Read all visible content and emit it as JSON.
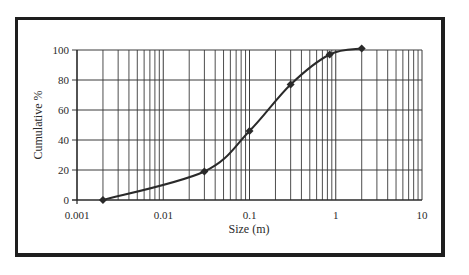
{
  "chart_data": {
    "type": "line",
    "title": "",
    "xlabel": "Size (m)",
    "ylabel": "Cumulative %",
    "xscale": "log",
    "xlim": [
      0.001,
      10
    ],
    "ylim": [
      0,
      100
    ],
    "x_ticks": [
      "0.001",
      "0.01",
      "0.1",
      "1",
      "10"
    ],
    "y_ticks": [
      "0",
      "20",
      "40",
      "60",
      "80",
      "100"
    ],
    "grid": true,
    "legend": null,
    "series": [
      {
        "name": "Cumulative %",
        "marker": "diamond",
        "color": "#2a2a2a",
        "x": [
          0.002,
          0.03,
          0.1,
          0.3,
          0.85,
          2.0
        ],
        "y": [
          0,
          19,
          46,
          77,
          97,
          101
        ]
      }
    ]
  },
  "colors": {
    "line": "#2a2a2a",
    "grid": "#3a3a3a",
    "frame": "#1e1e1e"
  }
}
